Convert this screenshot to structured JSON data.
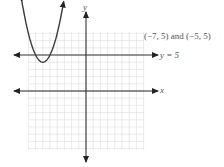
{
  "chart_data": {
    "type": "line",
    "title": "",
    "xlabel": "x",
    "ylabel": "y",
    "xlim": [
      -8,
      8
    ],
    "ylim": [
      -8,
      8
    ],
    "grid": true,
    "series": [
      {
        "name": "parabola",
        "equation": "y = (x + 6)^2 + 4",
        "vertex": [
          -6,
          4
        ],
        "points": [
          [
            -8.6,
            10.8
          ],
          [
            -7,
            5
          ],
          [
            -6,
            4
          ],
          [
            -5,
            5
          ],
          [
            -3.4,
            10.8
          ]
        ]
      },
      {
        "name": "y = 5",
        "equation": "y = 5",
        "points": [
          [
            -10,
            5
          ],
          [
            10,
            5
          ]
        ]
      }
    ],
    "annotations": [
      {
        "text": "(−7, 5) and (−5, 5)",
        "position": "upper right, above line y = 5"
      },
      {
        "text": "y = 5",
        "position": "right end of horizontal line"
      }
    ]
  },
  "labels": {
    "y_axis": "y",
    "x_axis": "x",
    "intersections": "(−7, 5) and (−5, 5)",
    "line_label": "y = 5"
  },
  "colors": {
    "axis": "#222222",
    "curve": "#3a3a3a",
    "grid": "#d9d9d9",
    "text": "#555555"
  }
}
